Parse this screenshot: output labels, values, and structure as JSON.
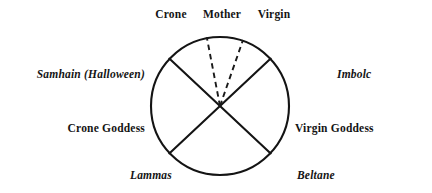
{
  "figure": {
    "title": "",
    "background_color": "#ffffff",
    "stroke_color": "#141414"
  },
  "wheel": {
    "center": {
      "x": 220,
      "y": 106
    },
    "radius": 69,
    "solid_divider_count": 2,
    "dashed_divider_count": 2,
    "solid_dividers": [
      {
        "name": "samhain-beltane-axis",
        "angle_deg": 208
      },
      {
        "name": "lammas-imbolc-axis",
        "angle_deg": 332
      }
    ],
    "dashed_dividers": [
      {
        "name": "crone-mother-divider",
        "angle_deg": 280
      },
      {
        "name": "mother-virgin-divider",
        "angle_deg": 260
      }
    ]
  },
  "labels": {
    "phases": [
      {
        "id": "crone",
        "text": "Crone",
        "style": "bold",
        "position": "top-left"
      },
      {
        "id": "mother",
        "text": "Mother",
        "style": "bold",
        "position": "top-center"
      },
      {
        "id": "virgin",
        "text": "Virgin",
        "style": "bold",
        "position": "top-right"
      }
    ],
    "sabbats": [
      {
        "id": "samhain",
        "text": "Samhain (Halloween)",
        "style": "bold-italic",
        "position": "upper-left"
      },
      {
        "id": "imbolc",
        "text": "Imbolc",
        "style": "bold-italic",
        "position": "upper-right"
      },
      {
        "id": "lammas",
        "text": "Lammas",
        "style": "bold-italic",
        "position": "lower-left"
      },
      {
        "id": "beltane",
        "text": "Beltane",
        "style": "bold-italic",
        "position": "lower-right"
      }
    ],
    "goddesses": [
      {
        "id": "crone-goddess",
        "text": "Crone Goddess",
        "style": "bold",
        "position": "left"
      },
      {
        "id": "virgin-goddess",
        "text": "Virgin Goddess",
        "style": "bold",
        "position": "right"
      }
    ]
  }
}
